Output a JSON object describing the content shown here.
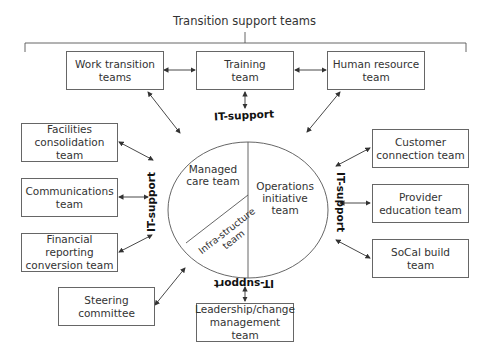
{
  "title": "Transition support teams",
  "top_teams": [
    {
      "id": "work-transition",
      "label": "Work transition\nteams"
    },
    {
      "id": "training",
      "label": "Training\nteam"
    },
    {
      "id": "human-resource",
      "label": "Human resource\nteam"
    }
  ],
  "left_teams": [
    {
      "id": "facilities",
      "label": "Facilities\nconsolidation team"
    },
    {
      "id": "communications",
      "label": "Communications\nteam"
    },
    {
      "id": "financial",
      "label": "Financial reporting\nconversion team"
    },
    {
      "id": "steering",
      "label": "Steering\ncommittee"
    }
  ],
  "right_teams": [
    {
      "id": "customer",
      "label": "Customer\nconnection team"
    },
    {
      "id": "provider",
      "label": "Provider\neducation team"
    },
    {
      "id": "socal",
      "label": "SoCal build\nteam"
    }
  ],
  "bottom_team": {
    "id": "leadership",
    "label": "Leadership/change\nmanagement team"
  },
  "core": {
    "managed_care": "Managed\ncare team",
    "operations": "Operations\ninitiative\nteam",
    "infrastructure": "Infra-structure\nteam"
  },
  "it_support_label": "IT-support"
}
